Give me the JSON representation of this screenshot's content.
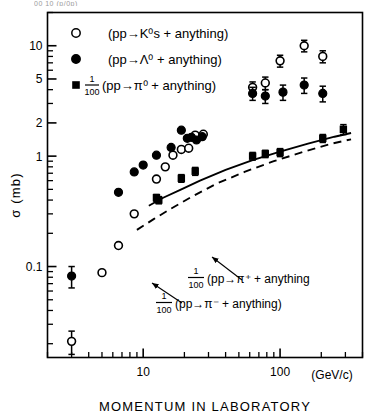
{
  "figure": {
    "top_cropped_text": "00 10 (p/0p)",
    "axes": {
      "x": {
        "label": "MOMENTUM IN LABORATORY",
        "units": "(GeV/c)",
        "scale": "log",
        "range": [
          2.0,
          400.0
        ],
        "major_ticks": [
          10,
          100
        ],
        "major_tick_labels": [
          "10",
          "100"
        ]
      },
      "y": {
        "label": "σ (mb)",
        "scale": "log",
        "range": [
          0.015,
          20.0
        ],
        "major_ticks": [
          0.1,
          1,
          2,
          5,
          10
        ],
        "major_tick_labels": [
          "0.1",
          "1",
          "2",
          "5",
          "10"
        ]
      }
    },
    "legend": {
      "items": [
        {
          "marker": "open-circle",
          "prefactor": "",
          "text": "(pp→K⁰s + anything)",
          "reaction_lhs": "pp",
          "arrow": "→",
          "particle": "K⁰s",
          "reaction_rhs": "+ anything"
        },
        {
          "marker": "filled-circle",
          "prefactor": "",
          "text": "(pp→Λ⁰ + anything)",
          "reaction_lhs": "pp",
          "arrow": "→",
          "particle": "Λ⁰",
          "reaction_rhs": "+ anything"
        },
        {
          "marker": "filled-square",
          "prefactor_num": "1",
          "prefactor_den": "100",
          "text": "(pp→π⁰ + anything)",
          "reaction_lhs": "pp",
          "arrow": "→",
          "particle": "π⁰",
          "reaction_rhs": "+ anything"
        }
      ]
    },
    "annotations": [
      {
        "id": "pi-plus-curve-label",
        "num": "1",
        "den": "100",
        "text": "(pp→π⁺ + anything",
        "curve": "solid"
      },
      {
        "id": "pi-minus-curve-label",
        "num": "1",
        "den": "100",
        "text": "(pp→π⁻ + anything)",
        "curve": "dashed"
      }
    ]
  },
  "chart_data": {
    "type": "scatter",
    "title": "",
    "xlabel": "MOMENTUM IN LABORATORY",
    "ylabel": "σ (mb)",
    "xunits": "GeV/c",
    "yunits": "mb",
    "xscale": "log",
    "yscale": "log",
    "xlim": [
      2.0,
      400.0
    ],
    "ylim": [
      0.015,
      20.0
    ],
    "grid": false,
    "legend_position": "top-left",
    "series": [
      {
        "name": "(pp→K⁰s + anything)",
        "marker": "open-circle",
        "points": [
          {
            "x": 3.0,
            "y": 0.021,
            "yerr_lo": 0.005,
            "yerr_hi": 0.005
          },
          {
            "x": 5.0,
            "y": 0.088,
            "yerr_lo": 0.0,
            "yerr_hi": 0.0
          },
          {
            "x": 6.6,
            "y": 0.155,
            "yerr_lo": 0.0,
            "yerr_hi": 0.0
          },
          {
            "x": 8.6,
            "y": 0.3,
            "yerr_lo": 0.0,
            "yerr_hi": 0.0
          },
          {
            "x": 12.5,
            "y": 0.62,
            "yerr_lo": 0.0,
            "yerr_hi": 0.0
          },
          {
            "x": 14.5,
            "y": 0.8,
            "yerr_lo": 0.0,
            "yerr_hi": 0.0
          },
          {
            "x": 16.5,
            "y": 1.02,
            "yerr_lo": 0.0,
            "yerr_hi": 0.0
          },
          {
            "x": 19.0,
            "y": 1.15,
            "yerr_lo": 0.0,
            "yerr_hi": 0.0
          },
          {
            "x": 21.5,
            "y": 1.18,
            "yerr_lo": 0.0,
            "yerr_hi": 0.0
          },
          {
            "x": 24.0,
            "y": 1.55,
            "yerr_lo": 0.0,
            "yerr_hi": 0.0
          },
          {
            "x": 27.5,
            "y": 1.58,
            "yerr_lo": 0.0,
            "yerr_hi": 0.0
          },
          {
            "x": 63.0,
            "y": 4.2,
            "yerr_lo": 0.5,
            "yerr_hi": 0.5
          },
          {
            "x": 78.0,
            "y": 4.6,
            "yerr_lo": 0.6,
            "yerr_hi": 0.6
          },
          {
            "x": 100.0,
            "y": 7.3,
            "yerr_lo": 0.9,
            "yerr_hi": 0.9
          },
          {
            "x": 150.0,
            "y": 10.0,
            "yerr_lo": 1.2,
            "yerr_hi": 1.2
          },
          {
            "x": 205.0,
            "y": 8.0,
            "yerr_lo": 1.0,
            "yerr_hi": 1.0
          }
        ]
      },
      {
        "name": "(pp→Λ⁰ + anything)",
        "marker": "filled-circle",
        "points": [
          {
            "x": 3.0,
            "y": 0.082,
            "yerr_lo": 0.018,
            "yerr_hi": 0.018
          },
          {
            "x": 6.6,
            "y": 0.47,
            "yerr_lo": 0.0,
            "yerr_hi": 0.0
          },
          {
            "x": 8.6,
            "y": 0.72,
            "yerr_lo": 0.0,
            "yerr_hi": 0.0
          },
          {
            "x": 10.0,
            "y": 0.83,
            "yerr_lo": 0.0,
            "yerr_hi": 0.0
          },
          {
            "x": 12.5,
            "y": 1.02,
            "yerr_lo": 0.0,
            "yerr_hi": 0.0
          },
          {
            "x": 16.0,
            "y": 1.2,
            "yerr_lo": 0.0,
            "yerr_hi": 0.0
          },
          {
            "x": 19.0,
            "y": 1.72,
            "yerr_lo": 0.0,
            "yerr_hi": 0.0
          },
          {
            "x": 21.0,
            "y": 1.45,
            "yerr_lo": 0.0,
            "yerr_hi": 0.0
          },
          {
            "x": 22.5,
            "y": 1.48,
            "yerr_lo": 0.0,
            "yerr_hi": 0.0
          },
          {
            "x": 24.5,
            "y": 1.4,
            "yerr_lo": 0.0,
            "yerr_hi": 0.0
          },
          {
            "x": 27.0,
            "y": 1.5,
            "yerr_lo": 0.0,
            "yerr_hi": 0.0
          },
          {
            "x": 63.0,
            "y": 3.7,
            "yerr_lo": 0.5,
            "yerr_hi": 0.5
          },
          {
            "x": 78.0,
            "y": 3.5,
            "yerr_lo": 0.5,
            "yerr_hi": 0.5
          },
          {
            "x": 105.0,
            "y": 3.8,
            "yerr_lo": 0.6,
            "yerr_hi": 0.6
          },
          {
            "x": 150.0,
            "y": 4.4,
            "yerr_lo": 0.7,
            "yerr_hi": 0.7
          },
          {
            "x": 205.0,
            "y": 3.7,
            "yerr_lo": 0.6,
            "yerr_hi": 0.6
          }
        ]
      },
      {
        "name": "1/100 (pp→π⁰ + anything)",
        "marker": "filled-square",
        "points": [
          {
            "x": 12.5,
            "y": 0.42,
            "yerr_lo": 0.03,
            "yerr_hi": 0.03
          },
          {
            "x": 13.0,
            "y": 0.4,
            "yerr_lo": 0.03,
            "yerr_hi": 0.03
          },
          {
            "x": 19.0,
            "y": 0.63,
            "yerr_lo": 0.05,
            "yerr_hi": 0.05
          },
          {
            "x": 24.0,
            "y": 0.73,
            "yerr_lo": 0.06,
            "yerr_hi": 0.06
          },
          {
            "x": 63.0,
            "y": 1.0,
            "yerr_lo": 0.08,
            "yerr_hi": 0.08
          },
          {
            "x": 78.0,
            "y": 1.05,
            "yerr_lo": 0.08,
            "yerr_hi": 0.08
          },
          {
            "x": 100.0,
            "y": 1.08,
            "yerr_lo": 0.09,
            "yerr_hi": 0.09
          },
          {
            "x": 205.0,
            "y": 1.45,
            "yerr_lo": 0.12,
            "yerr_hi": 0.12
          },
          {
            "x": 290.0,
            "y": 1.75,
            "yerr_lo": 0.18,
            "yerr_hi": 0.18
          }
        ]
      }
    ],
    "curves": [
      {
        "name": "1/100 (pp→π⁺ + anything)",
        "style": "solid",
        "x": [
          11.0,
          14.0,
          19.0,
          26.0,
          40.0,
          63.0,
          100.0,
          160.0,
          250.0,
          330.0
        ],
        "y": [
          0.355,
          0.42,
          0.5,
          0.6,
          0.75,
          0.92,
          1.1,
          1.3,
          1.5,
          1.62
        ]
      },
      {
        "name": "1/100 (pp→π⁻ + anything)",
        "style": "dashed",
        "x": [
          9.0,
          12.0,
          16.0,
          22.0,
          34.0,
          55.0,
          90.0,
          150.0,
          240.0,
          330.0
        ],
        "y": [
          0.215,
          0.27,
          0.335,
          0.42,
          0.56,
          0.72,
          0.9,
          1.1,
          1.3,
          1.42
        ]
      }
    ]
  }
}
